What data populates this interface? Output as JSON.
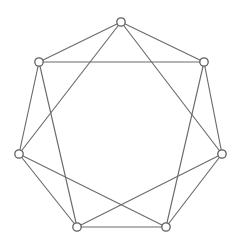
{
  "figure": {
    "kind": "graph-drawing",
    "background_color": "#ffffff",
    "width": 242,
    "height": 250
  },
  "style": {
    "edge_color": "#6b6b6b",
    "edge_width": 1.15,
    "vertex_fill": "#ffffff",
    "vertex_stroke": "#5e5e5e",
    "vertex_stroke_width": 1.3,
    "vertex_radius": 4.2
  },
  "chart_data": {
    "type": "scatter",
    "xlabel": "",
    "ylabel": "",
    "grid": false,
    "legend": "none",
    "xlim": [
      0,
      242
    ],
    "ylim": [
      0,
      250
    ],
    "graph": {
      "vertex_count": 7,
      "edge_count": 14,
      "regular_degree": 4,
      "layout": "circular-heptagon",
      "connection_distances": [
        1,
        2
      ],
      "center": [
        121,
        128
      ],
      "radius": 106
    },
    "nodes": [
      {
        "id": "v0",
        "label": "top",
        "x": 121,
        "y": 22
      },
      {
        "id": "v1",
        "label": "upper-right",
        "x": 204,
        "y": 62
      },
      {
        "id": "v2",
        "label": "right",
        "x": 222,
        "y": 154
      },
      {
        "id": "v3",
        "label": "bottom-right",
        "x": 166,
        "y": 227
      },
      {
        "id": "v4",
        "label": "bottom-left",
        "x": 77,
        "y": 227
      },
      {
        "id": "v5",
        "label": "left",
        "x": 19,
        "y": 154
      },
      {
        "id": "v6",
        "label": "upper-left",
        "x": 39,
        "y": 62
      }
    ],
    "edges": [
      {
        "source": "v0",
        "target": "v1",
        "distance": 1
      },
      {
        "source": "v1",
        "target": "v2",
        "distance": 1
      },
      {
        "source": "v2",
        "target": "v3",
        "distance": 1
      },
      {
        "source": "v3",
        "target": "v4",
        "distance": 1
      },
      {
        "source": "v4",
        "target": "v5",
        "distance": 1
      },
      {
        "source": "v5",
        "target": "v6",
        "distance": 1
      },
      {
        "source": "v6",
        "target": "v0",
        "distance": 1
      },
      {
        "source": "v0",
        "target": "v2",
        "distance": 2
      },
      {
        "source": "v1",
        "target": "v3",
        "distance": 2
      },
      {
        "source": "v2",
        "target": "v4",
        "distance": 2
      },
      {
        "source": "v3",
        "target": "v5",
        "distance": 2
      },
      {
        "source": "v4",
        "target": "v6",
        "distance": 2
      },
      {
        "source": "v5",
        "target": "v0",
        "distance": 2
      },
      {
        "source": "v6",
        "target": "v1",
        "distance": 2
      }
    ]
  }
}
